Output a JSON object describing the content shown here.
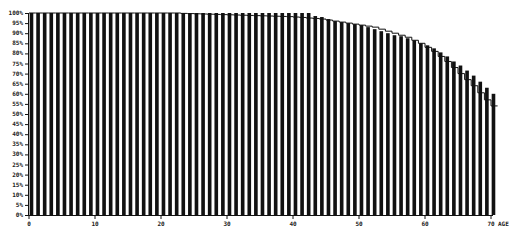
{
  "chart_data": {
    "type": "bar",
    "title": "",
    "xlabel": "AGE",
    "ylabel": "",
    "xlim": [
      0,
      70
    ],
    "ylim": [
      0,
      100
    ],
    "x_ticks": [
      0,
      10,
      20,
      30,
      40,
      50,
      60,
      70
    ],
    "x_tick_labels": [
      "0",
      "10",
      "20",
      "30",
      "40",
      "50",
      "60",
      "70"
    ],
    "y_ticks": [
      0,
      5,
      10,
      15,
      20,
      25,
      30,
      35,
      40,
      45,
      50,
      55,
      60,
      65,
      70,
      75,
      80,
      85,
      90,
      95,
      100
    ],
    "y_tick_labels": [
      "0%",
      "5%",
      "10%",
      "15%",
      "20%",
      "25%",
      "30%",
      "35%",
      "40%",
      "45%",
      "50%",
      "55%",
      "60%",
      "65%",
      "70%",
      "75%",
      "80%",
      "85%",
      "90%",
      "95%",
      "100%"
    ],
    "grid": false,
    "legend": null,
    "series": [
      {
        "name": "bars",
        "kind": "bar",
        "color": "#111111",
        "x": [
          0,
          1,
          2,
          3,
          4,
          5,
          6,
          7,
          8,
          9,
          10,
          11,
          12,
          13,
          14,
          15,
          16,
          17,
          18,
          19,
          20,
          21,
          22,
          23,
          24,
          25,
          26,
          27,
          28,
          29,
          30,
          31,
          32,
          33,
          34,
          35,
          36,
          37,
          38,
          39,
          40,
          41,
          42,
          43,
          44,
          45,
          46,
          47,
          48,
          49,
          50,
          51,
          52,
          53,
          54,
          55,
          56,
          57,
          58,
          59,
          60,
          61,
          62,
          63,
          64,
          65,
          66,
          67,
          68,
          69,
          70
        ],
        "values": [
          100,
          100,
          100,
          100,
          100,
          100,
          100,
          100,
          100,
          100,
          100,
          100,
          100,
          100,
          100,
          100,
          100,
          100,
          100,
          100,
          100,
          100,
          100,
          100,
          100,
          100,
          100,
          100,
          100,
          100,
          100,
          100,
          100,
          100,
          100,
          100,
          100,
          100,
          100,
          100,
          100,
          100,
          100,
          98.5,
          98,
          97,
          96,
          95.5,
          95,
          94.5,
          94,
          93,
          92,
          91,
          90,
          89,
          88.5,
          87.5,
          86.5,
          85,
          84,
          82.5,
          80.5,
          78.5,
          76,
          74,
          71.5,
          69,
          66,
          63,
          60
        ]
      },
      {
        "name": "step line",
        "kind": "step",
        "color": "#111111",
        "x": [
          0,
          1,
          2,
          3,
          4,
          5,
          6,
          7,
          8,
          9,
          10,
          11,
          12,
          13,
          14,
          15,
          16,
          17,
          18,
          19,
          20,
          21,
          22,
          23,
          24,
          25,
          26,
          27,
          28,
          29,
          30,
          31,
          32,
          33,
          34,
          35,
          36,
          37,
          38,
          39,
          40,
          41,
          42,
          43,
          44,
          45,
          46,
          47,
          48,
          49,
          50,
          51,
          52,
          53,
          54,
          55,
          56,
          57,
          58,
          59,
          60,
          61,
          62,
          63,
          64,
          65,
          66,
          67,
          68,
          69,
          70
        ],
        "values": [
          100,
          100,
          100,
          100,
          100,
          100,
          100,
          100,
          100,
          100,
          100,
          100,
          100,
          100,
          100,
          100,
          100,
          100,
          100,
          100,
          100,
          100,
          100,
          99.8,
          99.7,
          99.6,
          99.5,
          99.4,
          99.3,
          99.2,
          99.1,
          99,
          98.9,
          98.8,
          98.7,
          98.6,
          98.5,
          98.4,
          98.3,
          98.2,
          98,
          97.8,
          97.5,
          97.3,
          97,
          96.5,
          96,
          95.5,
          95,
          94.5,
          94,
          93.5,
          93,
          92,
          91,
          90,
          89,
          88,
          86.5,
          85,
          83,
          81,
          78.5,
          76,
          73,
          70,
          67,
          64,
          60.5,
          57,
          54
        ]
      }
    ]
  }
}
